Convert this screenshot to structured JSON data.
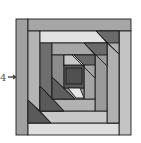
{
  "figure": {
    "type": "log-cabin quilt block diagram",
    "pointer_label": "4",
    "pointer_icon": "arrow-right-icon"
  },
  "colors": {
    "outline": "#1e1e1e",
    "very_light": "#dcdcdc",
    "light": "#bdbdbd",
    "medium": "#a0a0a0",
    "medium_dark": "#8a8a8a",
    "dark": "#6a6a6a",
    "darkest": "#4e4e4e"
  }
}
